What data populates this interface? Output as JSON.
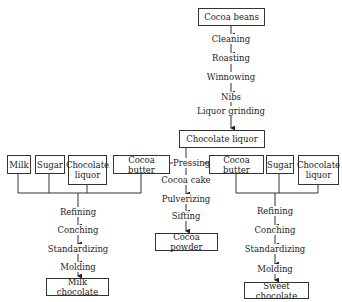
{
  "diagram": {
    "type": "flowchart",
    "title_node": "Cocoa beans",
    "main_steps": [
      "Cleaning",
      "Roasting",
      "Winnowing",
      "Nibs",
      "Liquor grinding"
    ],
    "hub_node": "Chocolate liquor",
    "pressing": "Pressing",
    "left_inputs": [
      "Milk",
      "Sugar",
      "Chocolate liquor",
      "Cocoa butter"
    ],
    "left_steps": [
      "Refining",
      "Conching",
      "Standardizing",
      "Molding"
    ],
    "left_output": "Milk chocolate",
    "center_steps": [
      "Cocoa cake",
      "Pulverizing",
      "Sifting"
    ],
    "center_output": "Cocoa powder",
    "right_inputs": [
      "Cocoa butter",
      "Sugar",
      "Chocolate liquor"
    ],
    "right_steps": [
      "Refining",
      "Conching",
      "Standardizing",
      "Molding"
    ],
    "right_output": "Sweet chocolate"
  }
}
